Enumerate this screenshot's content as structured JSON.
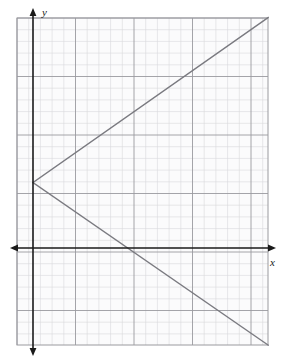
{
  "figure": {
    "title": "",
    "width": 283,
    "height": 361,
    "background_color": "#ffffff"
  },
  "axes": {
    "x_axis": {
      "label": "x",
      "label_icon": "x-axis-label",
      "color": "#1a1a1a",
      "arrow_left": true,
      "arrow_right": true,
      "pixel_y": 248,
      "pixel_x_start": 10,
      "pixel_x_end": 276
    },
    "y_axis": {
      "label": "y",
      "label_icon": "y-axis-label",
      "color": "#1a1a1a",
      "arrow_up": true,
      "arrow_down": true,
      "pixel_x": 33,
      "pixel_y_start": 8,
      "pixel_y_end": 356
    }
  },
  "grid": {
    "minor_color": "#d9d9dc",
    "major_color": "#9a9a9f",
    "border_color": "#9a9a9f",
    "minor_spacing_px": 11.7,
    "major_every": 5,
    "left_px": 17,
    "top_px": 18,
    "right_px": 268,
    "bottom_px": 345,
    "cells_x": 21,
    "cells_y": 28
  },
  "chart_data": {
    "type": "line",
    "title": "",
    "xlabel": "x",
    "ylabel": "y",
    "grid": true,
    "legend": "none",
    "units_per_cell": 1,
    "xlim": [
      -1.4,
      20.1
    ],
    "ylim": [
      -8.3,
      19.7
    ],
    "origin_cell": [
      1.4,
      19.7
    ],
    "vertex": [
      0,
      5.6
    ],
    "series": [
      {
        "name": "upper-ray",
        "points": [
          [
            0,
            5.6
          ],
          [
            20.1,
            19.7
          ]
        ],
        "slope_dy_dx": 0.7,
        "color": "#7a7a80",
        "width": 1.4
      },
      {
        "name": "lower-ray",
        "points": [
          [
            0,
            5.6
          ],
          [
            20.1,
            -8.3
          ]
        ],
        "slope_dy_dx": -0.69,
        "color": "#7a7a80",
        "width": 1.4
      }
    ]
  }
}
